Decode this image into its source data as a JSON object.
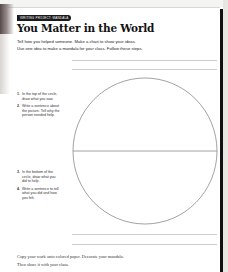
{
  "worksheet": {
    "tag_label": "WRITING PROJECT: MANDALA",
    "title": "You Matter in the World",
    "intro_lines": [
      "Tell how you helped someone. Make a chart to show your ideas.",
      "Use one idea to make a mandala for your class. Follow these steps."
    ],
    "steps_top": [
      {
        "num": "1.",
        "text": "In the top of the circle, draw what you saw."
      },
      {
        "num": "2.",
        "text": "Write a sentence about the picture. Tell why the person needed help."
      }
    ],
    "steps_bottom": [
      {
        "num": "3.",
        "text": "In the bottom of the circle, draw what you did to help."
      },
      {
        "num": "4.",
        "text": "Write a sentence to tell what you did and how you felt."
      }
    ],
    "footer_lines": [
      "Copy your work onto colored paper. Decorate your mandala.",
      "Then share it with your class."
    ]
  },
  "colors": {
    "text": "#111111",
    "rule_line": "#cfcfcf",
    "circle_stroke": "#8a8a8a",
    "tag_bg": "#1a1a1a"
  }
}
